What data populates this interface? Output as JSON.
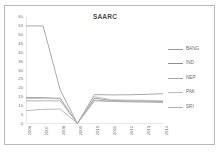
{
  "figure": {
    "title": "SAARC"
  },
  "chart_data": {
    "type": "line",
    "title": "SAARC",
    "xlabel": "",
    "ylabel": "",
    "categories": [
      "2006",
      "2007",
      "2008",
      "2009",
      "2010",
      "2011",
      "2012",
      "2013",
      "2014"
    ],
    "ylim": [
      0,
      60
    ],
    "ytick_labels": [
      "0",
      "5",
      "10",
      "15",
      "20",
      "25",
      "30",
      "35",
      "40",
      "45",
      "50",
      "55",
      "60"
    ],
    "ytick_values": [
      0,
      5,
      10,
      15,
      20,
      25,
      30,
      35,
      40,
      45,
      50,
      55,
      60
    ],
    "ytick_step": 5,
    "grid": false,
    "legend_position": "right",
    "series": [
      {
        "name": "BANG",
        "color": "#9b9b9b",
        "values": [
          55,
          55,
          19,
          0.3,
          16.5,
          16.3,
          16.4,
          16.6,
          17
        ]
      },
      {
        "name": "IND",
        "color": "#8f8f8f",
        "values": [
          14.8,
          14.8,
          14.2,
          0.3,
          14.5,
          13.2,
          13.0,
          13.0,
          12.7
        ]
      },
      {
        "name": "NEP",
        "color": "#a5a5a5",
        "values": [
          13,
          13,
          13,
          0.3,
          13.4,
          12.8,
          12.6,
          12.5,
          12.2
        ]
      },
      {
        "name": "PAK",
        "color": "#bdbdbd",
        "values": [
          14.3,
          14.3,
          14.6,
          0.3,
          15.3,
          13.6,
          13.4,
          13.3,
          13.0
        ]
      },
      {
        "name": "SRI",
        "color": "#b0b0b0",
        "values": [
          7.5,
          8.2,
          8.4,
          0.3,
          13.0,
          12.6,
          12.4,
          12.3,
          12.0
        ]
      }
    ]
  }
}
